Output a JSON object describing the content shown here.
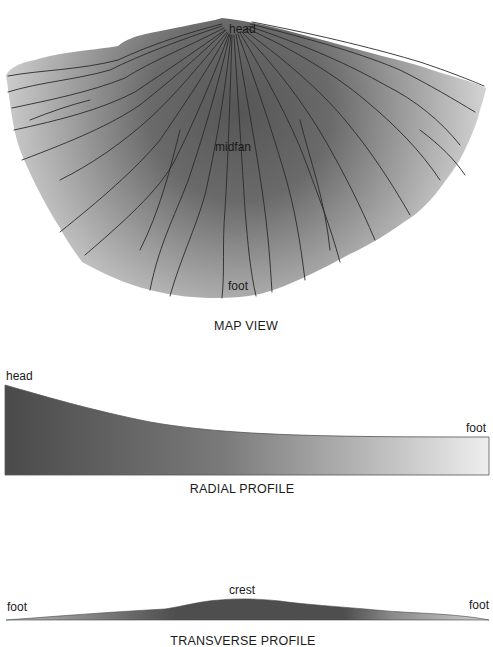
{
  "figure": {
    "map_view": {
      "caption": "MAP VIEW",
      "labels": {
        "head": "head",
        "midfan": "midfan",
        "foot": "foot"
      }
    },
    "radial_profile": {
      "caption": "RADIAL PROFILE",
      "labels": {
        "left": "head",
        "right": "foot"
      }
    },
    "transverse_profile": {
      "caption": "TRANSVERSE PROFILE",
      "labels": {
        "left": "foot",
        "center": "crest",
        "right": "foot"
      }
    },
    "colors": {
      "fan_dark": "#555555",
      "fan_light": "#e8e8e8",
      "channel": "#2a2a2a",
      "background": "#ffffff"
    }
  }
}
